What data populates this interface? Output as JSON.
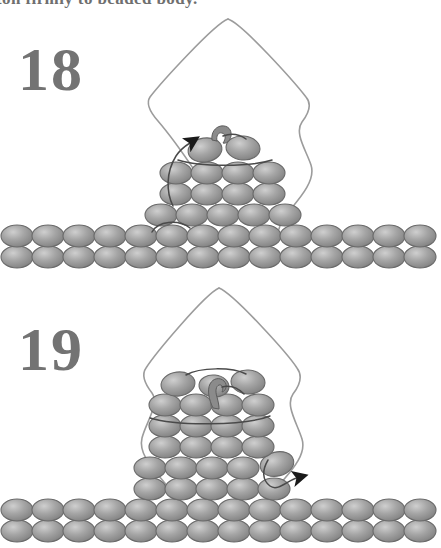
{
  "page": {
    "caption_top": "ton firmly to beaded body.",
    "background_color": "#ffffff"
  },
  "colors": {
    "bead_fill": "#9a9a9a",
    "bead_fill_light": "#c8c8c8",
    "bead_fill_dark": "#7d7d7d",
    "bead_outline": "#6a6a6a",
    "thread": "#4a4a4a",
    "outline_thread": "#9c9c9c",
    "arrow": "#1a1a1a",
    "numeral": "#737373",
    "caption": "#6f6f6f"
  },
  "steps": [
    {
      "number": "18",
      "label": "Step 18 beadwork diagram",
      "bead_rows": [
        2,
        4,
        4,
        5,
        14,
        14
      ],
      "total_beads": 43,
      "has_needle": true,
      "arrow_direction": "up-left",
      "arrow_label": "thread exits upward at left of top beads",
      "outline_shape": "diamond-kite"
    },
    {
      "number": "19",
      "label": "Step 19 beadwork diagram",
      "bead_rows": [
        3,
        4,
        4,
        4,
        5,
        5,
        14,
        14
      ],
      "total_beads": 53,
      "has_needle": true,
      "arrow_direction": "right",
      "arrow_label": "thread exits rightward at lower right of pyramid",
      "outline_shape": "diamond-kite"
    }
  ],
  "icons": {
    "needle": "needle-icon",
    "arrow": "arrow-icon",
    "bead": "bead-icon"
  }
}
